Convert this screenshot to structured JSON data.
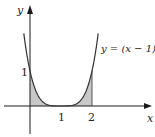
{
  "chart_data": {
    "type": "area",
    "title": "",
    "function": "y = (x - 1)^4",
    "curve_label": "y = (x − 1)⁴",
    "xlabel": "x",
    "ylabel": "y",
    "x_ticks": [
      {
        "value": 1,
        "label": "1"
      },
      {
        "value": 2,
        "label": "2"
      }
    ],
    "y_ticks": [
      {
        "value": 1,
        "label": "1"
      }
    ],
    "xlim": [
      -0.95,
      2.9
    ],
    "ylim": [
      -0.85,
      2.9
    ],
    "shaded_region": {
      "from_x": 0,
      "to_x": 2,
      "under": "y = (x - 1)^4",
      "color": "#c8c8c8"
    },
    "curve_domain": [
      -0.2,
      2.2
    ],
    "grid": false,
    "legend": "none",
    "points": [
      {
        "x": -0.2,
        "y": 2.07
      },
      {
        "x": 0,
        "y": 1
      },
      {
        "x": 0.5,
        "y": 0.0625
      },
      {
        "x": 1,
        "y": 0
      },
      {
        "x": 1.5,
        "y": 0.0625
      },
      {
        "x": 2,
        "y": 1
      },
      {
        "x": 2.2,
        "y": 2.07
      }
    ]
  },
  "colors": {
    "axis": "#1a1a1a",
    "curve": "#333333",
    "fill": "#c8c8c8"
  }
}
